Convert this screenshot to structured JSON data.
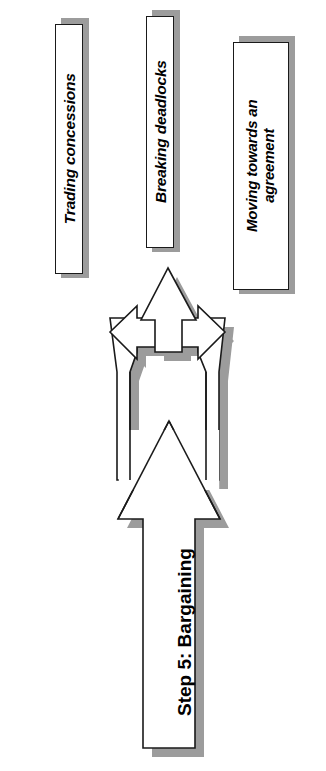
{
  "diagram": {
    "title": "Step 5: Bargaining",
    "orientation": "rotated-90-ccw",
    "type": "splitting-arrow-flow",
    "colors": {
      "outline": "#1a1a1a",
      "fill": "#ffffff",
      "shadow": "#9c9c9c",
      "background": "#ffffff",
      "text": "#000000"
    },
    "main_arrow": {
      "label": "Step 5: Bargaining"
    },
    "branches": [
      {
        "id": "branch-1",
        "direction": "left",
        "label": "Trading concessions"
      },
      {
        "id": "branch-2",
        "direction": "center",
        "label": "Breaking deadlocks"
      },
      {
        "id": "branch-3",
        "direction": "right",
        "label": "Moving towards an agreement"
      }
    ],
    "boxes": [
      {
        "id": "box-trading-concessions",
        "label": "Trading concessions",
        "lines": [
          "Trading concessions"
        ]
      },
      {
        "id": "box-breaking-deadlocks",
        "label": "Breaking deadlocks",
        "lines": [
          "Breaking deadlocks"
        ]
      },
      {
        "id": "box-moving-towards-agreement",
        "label": "Moving towards an agreement",
        "lines": [
          "Moving towards an",
          "agreement"
        ]
      }
    ]
  }
}
